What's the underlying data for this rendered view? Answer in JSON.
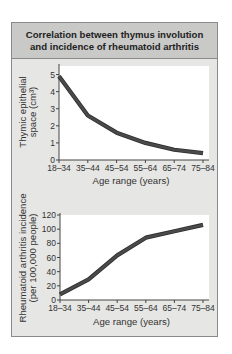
{
  "figure": {
    "title_lines": [
      "Correlation between thymus involution",
      "and incidence of rheumatoid arthritis"
    ],
    "colors": {
      "line": "#4a4a4a",
      "plot_bg": "#ffffff",
      "panel_bg": "#e6e6e4",
      "title_bg": "#c9c9c7"
    }
  },
  "chart_data": [
    {
      "type": "line",
      "title": "",
      "categories": [
        "18–34",
        "35–44",
        "45–54",
        "55–64",
        "65–74",
        "75–84"
      ],
      "series": [
        {
          "name": "Thymic epithelial space",
          "values": [
            4.9,
            2.6,
            1.6,
            1.0,
            0.6,
            0.4
          ]
        }
      ],
      "xlabel": "Age range (years)",
      "ylabel_lines": [
        "Thymic epithelial",
        "space (cm³)"
      ],
      "ylim": [
        0,
        5.5
      ],
      "yticks": [
        0,
        1,
        2,
        3,
        4,
        5
      ],
      "grid": false,
      "legend": "none"
    },
    {
      "type": "line",
      "title": "",
      "categories": [
        "18–34",
        "35–44",
        "45–54",
        "55–64",
        "65–74",
        "75–84"
      ],
      "series": [
        {
          "name": "Rheumatoid arthritis incidence",
          "values": [
            8,
            29,
            63,
            88,
            97,
            106
          ]
        }
      ],
      "xlabel": "Age range (years)",
      "ylabel_lines": [
        "Rheumatoid arthritis incidence",
        "(per 100,000 people)"
      ],
      "ylim": [
        0,
        120
      ],
      "yticks": [
        0,
        20,
        40,
        60,
        80,
        100,
        120
      ],
      "grid": false,
      "legend": "none"
    }
  ]
}
